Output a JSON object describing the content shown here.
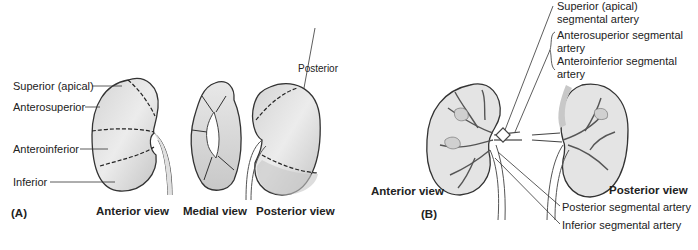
{
  "panel_a": {
    "tag": "(A)",
    "labels": {
      "superior": "Superior (apical)",
      "anterosuperior": "Anterosuperior",
      "anteroinferior": "Anteroinferior",
      "inferior": "Inferior",
      "posterior": "Posterior"
    },
    "views": {
      "anterior": "Anterior view",
      "medial": "Medial view",
      "posterior": "Posterior view"
    }
  },
  "panel_b": {
    "tag": "(B)",
    "labels": {
      "superior_l1": "Superior (apical)",
      "superior_l2": "segmental artery",
      "anterosuperior_l1": "Anterosuperior segmental",
      "anterosuperior_l2": "artery",
      "anteroinferior_l1": "Anteroinferior segmental",
      "anteroinferior_l2": "artery",
      "posterior_seg": "Posterior segmental artery",
      "inferior_seg": "Inferior segmental artery"
    },
    "views": {
      "anterior": "Anterior view",
      "posterior": "Posterior view"
    }
  },
  "colors": {
    "outline": "#333333",
    "fill_light": "#e6e6e6",
    "fill_mid": "#cfcfcf",
    "fill_dark": "#bdbdbd"
  }
}
